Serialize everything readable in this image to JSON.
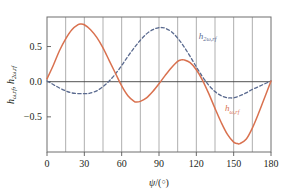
{
  "chart_data": {
    "type": "line",
    "title": "",
    "xlabel": "ψ/(°)",
    "ylabel": "hω,rf, h2ω,rf",
    "xlim": [
      0,
      180
    ],
    "ylim": [
      -1.0,
      0.92
    ],
    "xticks": [
      0,
      30,
      60,
      90,
      120,
      150,
      180
    ],
    "xtick_labels": [
      "0",
      "30",
      "60",
      "90",
      "120",
      "150",
      "180"
    ],
    "yticks": [
      -0.5,
      0.0,
      0.5
    ],
    "ytick_labels": [
      "-0.5",
      "0.0",
      "0.5"
    ],
    "grid": "vertical gridlines every 15 degrees",
    "gridlines_x": [
      15,
      30,
      45,
      60,
      75,
      90,
      105,
      120,
      135,
      150,
      165
    ],
    "zero_line": true,
    "legend": "inline annotations",
    "series": [
      {
        "name": "hω,rf",
        "label_text": "h",
        "label_sub": "ω,rf",
        "color": "#d9714f",
        "style": "solid",
        "x": [
          0,
          5,
          10,
          15,
          20,
          25,
          27,
          30,
          35,
          40,
          45,
          50,
          55,
          60,
          65,
          70,
          72,
          75,
          80,
          85,
          90,
          95,
          100,
          105,
          108,
          110,
          115,
          120,
          125,
          130,
          135,
          140,
          145,
          150,
          153,
          155,
          160,
          165,
          170,
          175,
          180
        ],
        "y": [
          0.04,
          0.23,
          0.44,
          0.61,
          0.74,
          0.81,
          0.82,
          0.81,
          0.74,
          0.63,
          0.48,
          0.3,
          0.12,
          -0.06,
          -0.2,
          -0.28,
          -0.29,
          -0.28,
          -0.23,
          -0.14,
          -0.03,
          0.09,
          0.2,
          0.29,
          0.31,
          0.31,
          0.27,
          0.17,
          0.02,
          -0.17,
          -0.38,
          -0.58,
          -0.75,
          -0.86,
          -0.88,
          -0.88,
          -0.82,
          -0.66,
          -0.45,
          -0.22,
          0.01
        ]
      },
      {
        "name": "h2ω,rf",
        "label_text": "h",
        "label_sub": "2ω,rf",
        "color": "#5a6a8f",
        "style": "dashed",
        "x": [
          0,
          5,
          10,
          15,
          20,
          25,
          30,
          33,
          35,
          40,
          45,
          50,
          55,
          60,
          65,
          70,
          75,
          80,
          85,
          90,
          92,
          95,
          100,
          105,
          110,
          115,
          120,
          125,
          130,
          135,
          140,
          145,
          147,
          150,
          155,
          160,
          165,
          170,
          175,
          180
        ],
        "y": [
          0.01,
          -0.04,
          -0.09,
          -0.13,
          -0.16,
          -0.17,
          -0.17,
          -0.17,
          -0.16,
          -0.13,
          -0.07,
          0.01,
          0.11,
          0.23,
          0.36,
          0.48,
          0.59,
          0.68,
          0.74,
          0.77,
          0.77,
          0.76,
          0.71,
          0.62,
          0.5,
          0.36,
          0.21,
          0.07,
          -0.05,
          -0.14,
          -0.2,
          -0.23,
          -0.23,
          -0.23,
          -0.2,
          -0.16,
          -0.11,
          -0.07,
          -0.03,
          0.01
        ]
      }
    ],
    "annotations": [
      {
        "name": "h2w-label",
        "text": "h2ω,rf",
        "x_deg": 122,
        "y_val": 0.61,
        "color": "#5a6a8f"
      },
      {
        "name": "hw-label",
        "text": "hω,rf",
        "x_deg": 143,
        "y_val": -0.42,
        "color": "#d9714f"
      }
    ]
  },
  "colors": {
    "orange": "#d9714f",
    "blue": "#5a6a8f",
    "axis": "#595959",
    "grid": "#8c8c8c",
    "text": "#231f20",
    "background": "#ffffff"
  }
}
